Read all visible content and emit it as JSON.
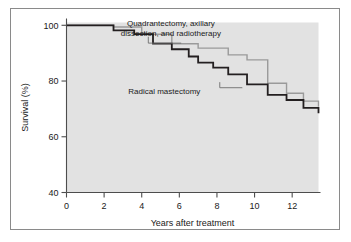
{
  "figure": {
    "background_color": "#ffffff",
    "frame_color": "#8a8a8a",
    "plot_background_color": "#e2e2e2"
  },
  "chart_data": {
    "type": "line",
    "subtype": "kaplan-meier-step",
    "title": "",
    "subtitle": "",
    "xlabel": "Years after treatment",
    "ylabel": "Survival (%)",
    "xlim": [
      0,
      13.4
    ],
    "ylim": [
      40,
      101
    ],
    "xticks": [
      0,
      2,
      4,
      6,
      8,
      10,
      12
    ],
    "xticklabels": [
      "0",
      "2",
      "4",
      "6",
      "8",
      "10",
      "12"
    ],
    "yticks": [
      40,
      60,
      80,
      100
    ],
    "yticklabels": [
      "40",
      "60",
      "80",
      "100"
    ],
    "grid": false,
    "legend_position": "inline-annotations",
    "series": [
      {
        "name": "Quadrantectomy, axillary dissection, and radiotherapy",
        "color": "#9a9a9a",
        "linewidth": 1.4,
        "step_x": [
          0,
          1.5,
          2.5,
          3.6,
          4.0,
          4.6,
          5.6,
          6.5,
          7.0,
          7.8,
          8.6,
          9.0,
          9.6,
          10.0,
          10.7,
          11.7,
          12.6,
          13.4
        ],
        "step_y": [
          100,
          100,
          99.4,
          99.4,
          96.8,
          96.8,
          93.4,
          93.4,
          91.8,
          91.8,
          89.4,
          89.4,
          87.6,
          87.6,
          79.2,
          75.6,
          72.8,
          70.8
        ]
      },
      {
        "name": "Radical mastectomy",
        "color": "#231f20",
        "linewidth": 1.8,
        "step_x": [
          0,
          1.5,
          2.5,
          3.6,
          4.6,
          5.6,
          6.5,
          7.0,
          7.8,
          8.6,
          9.6,
          10.7,
          11.7,
          12.6,
          13.4
        ],
        "step_y": [
          100,
          100,
          98.2,
          96.8,
          93.4,
          91.4,
          88.8,
          86.6,
          84.8,
          82.4,
          78.8,
          75.0,
          73.2,
          70.4,
          68.4
        ]
      }
    ],
    "annotations": [
      {
        "id": "annot-quadrantectomy",
        "lines": [
          "Quadrantectomy, axillary",
          "dissection, and radiotherapy"
        ],
        "text_x": 5.55,
        "text_y": 99.6,
        "leader": [
          [
            4.35,
            95.9
          ],
          [
            4.35,
            93.6
          ],
          [
            6.1,
            93.6
          ]
        ]
      },
      {
        "id": "annot-radical-mastectomy",
        "lines": [
          "Radical mastectomy"
        ],
        "text_x": 5.2,
        "text_y": 75.4,
        "leader": [
          [
            8.15,
            79.6
          ],
          [
            8.15,
            77.6
          ],
          [
            9.35,
            77.6
          ]
        ]
      }
    ]
  }
}
